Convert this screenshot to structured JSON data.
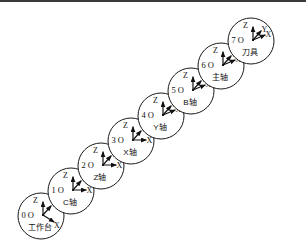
{
  "figure": {
    "width": 306,
    "height": 249,
    "background_color": "#ffffff",
    "line_color": "#111111",
    "border_color": "#3a3a3a"
  },
  "chart_data": {
    "type": "diagram",
    "title": "",
    "layout": {
      "circle_radius": 23,
      "step_x": 30,
      "step_y": -25,
      "first_center": [
        41,
        216
      ],
      "direction": "lower-left to upper-right"
    },
    "axis_labels": [
      "Z",
      "Y",
      "X"
    ],
    "origin_symbol": "O",
    "nodes": [
      {
        "index": "0",
        "origin": "0 O",
        "name": "工作台",
        "cx": 41,
        "cy": 216,
        "x_axis_dir": "down-right"
      },
      {
        "index": "1",
        "origin": "1 O",
        "name": "C轴",
        "cx": 71,
        "cy": 191,
        "x_axis_dir": "right"
      },
      {
        "index": "2",
        "origin": "2 O",
        "name": "Z轴",
        "cx": 101,
        "cy": 166,
        "x_axis_dir": "right"
      },
      {
        "index": "3",
        "origin": "3 O",
        "name": "X轴",
        "cx": 131,
        "cy": 141,
        "x_axis_dir": "right"
      },
      {
        "index": "4",
        "origin": "4 O",
        "name": "Y轴",
        "cx": 161,
        "cy": 116,
        "x_axis_dir": "up-right"
      },
      {
        "index": "5",
        "origin": "5 O",
        "name": "B轴",
        "cx": 191,
        "cy": 91,
        "x_axis_dir": "up-right"
      },
      {
        "index": "6",
        "origin": "6 O",
        "name": "主轴",
        "cx": 221,
        "cy": 66,
        "x_axis_dir": "up-right"
      },
      {
        "index": "7",
        "origin": "7 O",
        "name": "刀具",
        "cx": 251,
        "cy": 41,
        "x_axis_dir": "up-right"
      }
    ]
  }
}
